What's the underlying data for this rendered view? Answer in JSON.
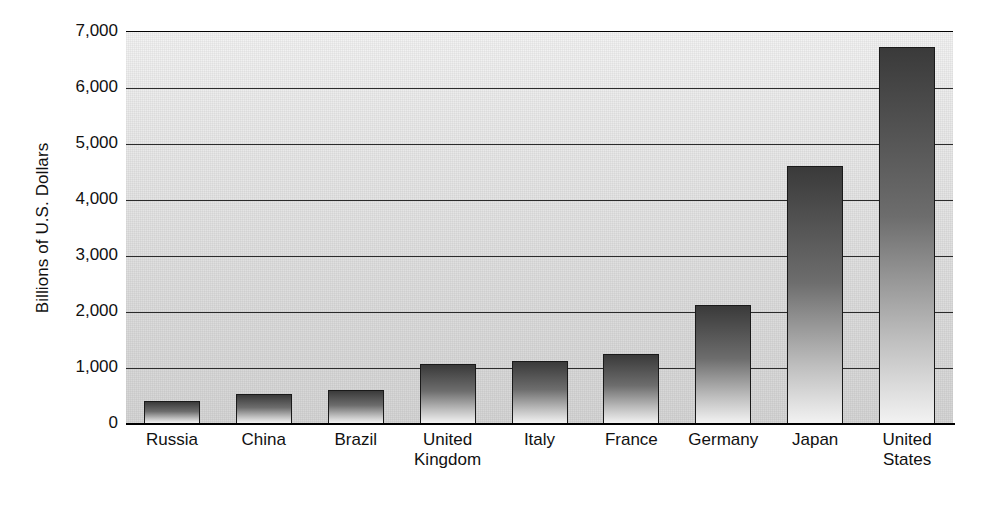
{
  "chart_data": {
    "type": "bar",
    "title": "",
    "xlabel": "",
    "ylabel": "Billions of U.S. Dollars",
    "categories": [
      "Russia",
      "China",
      "Brazil",
      "United Kingdom",
      "Italy",
      "France",
      "Germany",
      "Japan",
      "United States"
    ],
    "category_lines": [
      [
        "Russia"
      ],
      [
        "China"
      ],
      [
        "Brazil"
      ],
      [
        "United",
        "Kingdom"
      ],
      [
        "Italy"
      ],
      [
        "France"
      ],
      [
        "Germany"
      ],
      [
        "Japan"
      ],
      [
        "United",
        "States"
      ]
    ],
    "values": [
      410,
      535,
      605,
      1075,
      1130,
      1255,
      2130,
      4600,
      6740
    ],
    "ylim": [
      0,
      7000
    ],
    "ytick_values": [
      0,
      1000,
      2000,
      3000,
      4000,
      5000,
      6000,
      7000
    ],
    "ytick_labels": [
      "0",
      "1,000",
      "2,000",
      "3,000",
      "4,000",
      "5,000",
      "6,000",
      "7,000"
    ],
    "grid": true,
    "grid_axis": "y",
    "legend": "none",
    "orientation": "vertical"
  },
  "style": {
    "bar_fill_top": "#3a3a3a",
    "bar_fill_bottom": "#f2f2f2",
    "bar_border": "#1a1a1a",
    "plot_background": "#e4e4e4",
    "gridline_color": "#2b2b2b",
    "text_color": "#111111"
  }
}
